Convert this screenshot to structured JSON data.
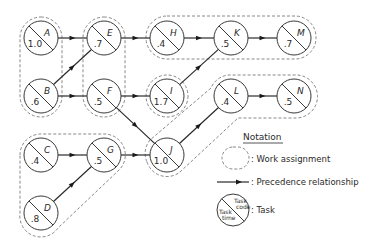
{
  "diagram": {
    "colors": {
      "line": "#2a2a2a",
      "dashed": "#6a6a6a",
      "background": "#ffffff"
    },
    "radius": 17,
    "nodes": [
      {
        "id": "A",
        "code": "A",
        "time": "1.0",
        "x": 41,
        "y": 38
      },
      {
        "id": "B",
        "code": "B",
        "time": ".6",
        "x": 41,
        "y": 96
      },
      {
        "id": "E",
        "code": "E",
        "time": ".7",
        "x": 104,
        "y": 38
      },
      {
        "id": "F",
        "code": "F",
        "time": ".5",
        "x": 104,
        "y": 96
      },
      {
        "id": "H",
        "code": "H",
        "time": ".4",
        "x": 167,
        "y": 38
      },
      {
        "id": "K",
        "code": "K",
        "time": ".5",
        "x": 231,
        "y": 38
      },
      {
        "id": "M",
        "code": "M",
        "time": ".7",
        "x": 294,
        "y": 38
      },
      {
        "id": "I",
        "code": "I",
        "time": "1.7",
        "x": 167,
        "y": 96
      },
      {
        "id": "L",
        "code": "L",
        "time": ".4",
        "x": 231,
        "y": 96
      },
      {
        "id": "N",
        "code": "N",
        "time": ".5",
        "x": 294,
        "y": 96
      },
      {
        "id": "C",
        "code": "C",
        "time": ".4",
        "x": 41,
        "y": 155
      },
      {
        "id": "G",
        "code": "G",
        "time": ".5",
        "x": 104,
        "y": 155
      },
      {
        "id": "J",
        "code": "J",
        "time": "1.0",
        "x": 167,
        "y": 155
      },
      {
        "id": "D",
        "code": "D",
        "time": ".8",
        "x": 41,
        "y": 213
      }
    ],
    "edges": [
      {
        "from": "A",
        "to": "E"
      },
      {
        "from": "B",
        "to": "E"
      },
      {
        "from": "B",
        "to": "F"
      },
      {
        "from": "E",
        "to": "H"
      },
      {
        "from": "H",
        "to": "K"
      },
      {
        "from": "K",
        "to": "M"
      },
      {
        "from": "F",
        "to": "I"
      },
      {
        "from": "I",
        "to": "K"
      },
      {
        "from": "F",
        "to": "J"
      },
      {
        "from": "C",
        "to": "G"
      },
      {
        "from": "D",
        "to": "G"
      },
      {
        "from": "G",
        "to": "J"
      },
      {
        "from": "J",
        "to": "L"
      },
      {
        "from": "L",
        "to": "N"
      }
    ],
    "work_assignments": [
      {
        "name": "A-B",
        "tasks": [
          "A",
          "B"
        ]
      },
      {
        "name": "E-F",
        "tasks": [
          "E",
          "F"
        ]
      },
      {
        "name": "H-K-M",
        "tasks": [
          "H",
          "K",
          "M"
        ]
      },
      {
        "name": "I",
        "tasks": [
          "I"
        ]
      },
      {
        "name": "J-L-N",
        "tasks": [
          "J",
          "L",
          "N"
        ]
      },
      {
        "name": "C-G-D",
        "tasks": [
          "C",
          "G",
          "D"
        ]
      }
    ]
  },
  "legend": {
    "title": "Notation",
    "work_assignment_label": ": Work assignment",
    "precedence_label": ": Precedence relationship",
    "task_label": ": Task",
    "task_code_line1": "Task",
    "task_code_line2": "code",
    "task_time_line1": "Task",
    "task_time_line2": "time"
  }
}
